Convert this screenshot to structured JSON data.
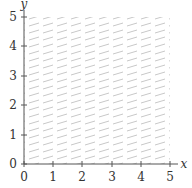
{
  "figure": {
    "x_axis_label": "x",
    "y_axis_label": "y",
    "x_ticks": [
      "0",
      "1",
      "2",
      "3",
      "4",
      "5"
    ],
    "y_ticks": [
      "0",
      "1",
      "2",
      "3",
      "4",
      "5"
    ],
    "shaded_region": {
      "x_min": 0,
      "x_max": 5,
      "y_min": 0,
      "y_max": 5,
      "style": "diagonal-hatch"
    },
    "colors": {
      "axis": "#555555",
      "hatch": "#c8c8c8",
      "text": "#333333"
    }
  }
}
